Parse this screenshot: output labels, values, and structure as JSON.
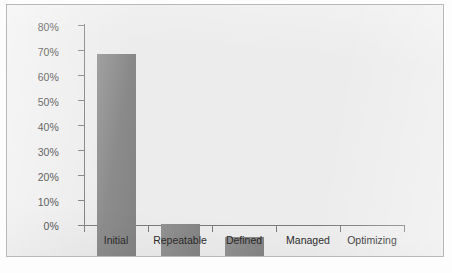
{
  "chart_data": {
    "type": "bar",
    "title": "",
    "subtitle": "",
    "xlabel": "",
    "ylabel": "",
    "categories": [
      "Initial",
      "Repeatable",
      "Defined",
      "Managed",
      "Optimizing"
    ],
    "values": [
      80,
      12.5,
      7.5,
      0,
      0
    ],
    "value_labels": [
      "80%",
      "12.5%",
      "7.5%",
      "0%",
      "0%"
    ],
    "ylim": [
      0,
      80
    ],
    "ytick_values": [
      0,
      10,
      20,
      30,
      40,
      50,
      60,
      70,
      80
    ],
    "ytick_labels": [
      "0%",
      "10%",
      "20%",
      "30%",
      "40%",
      "50%",
      "60%",
      "70%",
      "80%"
    ],
    "grid": false,
    "legend": false,
    "legend_position": "none",
    "series": [
      {
        "name": "",
        "values": [
          80,
          12.5,
          7.5,
          0,
          0
        ]
      }
    ],
    "colors": {
      "bar": "#8a8a8a",
      "axis": "#7c7c7c",
      "text": "#2b2b2b",
      "plot_background": "#ececec",
      "panel_border": "#b9b9b9",
      "page_background": "#fdfdfd"
    }
  }
}
